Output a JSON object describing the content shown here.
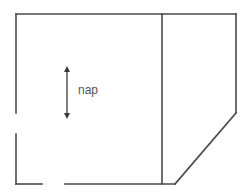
{
  "diagram": {
    "type": "floor-plan",
    "labels": {
      "nap": "nap"
    },
    "colors": {
      "wall": "#4a4a4a",
      "text": "#555555",
      "background": "#ffffff"
    },
    "elements": {
      "walls": [
        {
          "name": "top-wall",
          "x1": 16,
          "y1": 14,
          "x2": 236,
          "y2": 14
        },
        {
          "name": "left-wall-upper",
          "x1": 16,
          "y1": 14,
          "x2": 16,
          "y2": 113
        },
        {
          "name": "left-wall-lower",
          "x1": 16,
          "y1": 134,
          "x2": 16,
          "y2": 184
        },
        {
          "name": "bottom-wall-left",
          "x1": 16,
          "y1": 184,
          "x2": 42,
          "y2": 184
        },
        {
          "name": "bottom-wall-right",
          "x1": 65,
          "y1": 184,
          "x2": 175,
          "y2": 184
        },
        {
          "name": "divider-wall",
          "x1": 162,
          "y1": 14,
          "x2": 162,
          "y2": 184
        },
        {
          "name": "right-wall",
          "x1": 236,
          "y1": 14,
          "x2": 236,
          "y2": 113
        },
        {
          "name": "diagonal-wall",
          "x1": 236,
          "y1": 113,
          "x2": 175,
          "y2": 184
        }
      ],
      "openings": [
        {
          "name": "left-door-gap",
          "side": "left",
          "from": 113,
          "to": 134
        },
        {
          "name": "bottom-door-gap",
          "side": "bottom",
          "from": 42,
          "to": 65
        }
      ],
      "arrow": {
        "name": "nap-direction-arrow",
        "x": 67,
        "y1": 67,
        "y2": 118,
        "double_headed": true
      }
    }
  }
}
